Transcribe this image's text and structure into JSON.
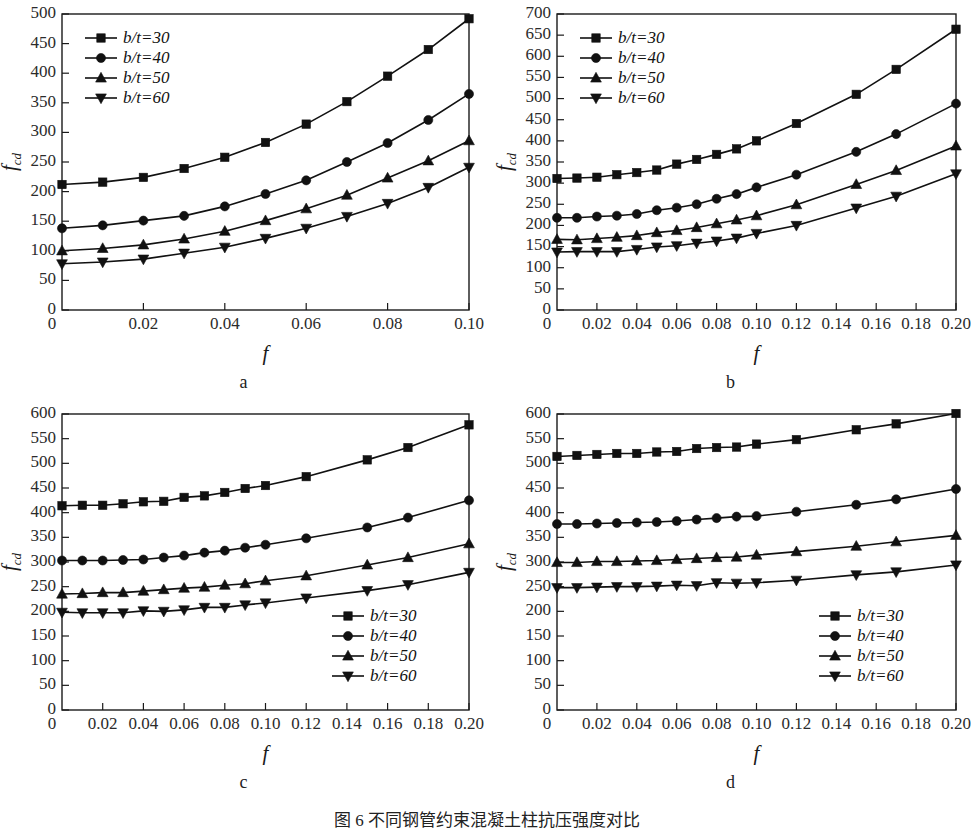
{
  "figure": {
    "caption": "图 6    不同钢管约束混凝土柱抗压强度对比",
    "axis_labels": {
      "x": "f",
      "y_base": "f",
      "y_sub": "cd"
    },
    "legend_labels": [
      "b/t=30",
      "b/t=40",
      "b/t=50",
      "b/t=60"
    ],
    "legend_markers": [
      "square-marker",
      "circle-marker",
      "triangle-up-marker",
      "triangle-down-marker"
    ]
  },
  "chart_data": [
    {
      "id": "a",
      "type": "line",
      "panel_letter": "a",
      "title": "",
      "xlabel": "f",
      "ylabel": "f_cd",
      "xlim": [
        0,
        0.1
      ],
      "ylim": [
        0,
        500
      ],
      "ytick_step": 50,
      "yticks": [
        0,
        50,
        100,
        150,
        200,
        250,
        300,
        350,
        400,
        450,
        500
      ],
      "xticks": [
        0,
        0.02,
        0.04,
        0.06,
        0.08,
        0.1
      ],
      "xtick_labels": [
        "0",
        "0.02",
        "0.04",
        "0.06",
        "0.08",
        "0.10"
      ],
      "grid": false,
      "legend_position": "top-left",
      "x": [
        0,
        0.01,
        0.02,
        0.03,
        0.04,
        0.05,
        0.06,
        0.07,
        0.08,
        0.09,
        0.1
      ],
      "series": [
        {
          "name": "b/t=30",
          "marker": "square",
          "values": [
            212,
            216,
            224,
            239,
            258,
            283,
            314,
            352,
            395,
            440,
            492
          ]
        },
        {
          "name": "b/t=40",
          "marker": "circle",
          "values": [
            138,
            143,
            151,
            159,
            175,
            196,
            219,
            250,
            282,
            321,
            365
          ]
        },
        {
          "name": "b/t=50",
          "marker": "triangle-up",
          "values": [
            100,
            104,
            110,
            120,
            133,
            151,
            171,
            194,
            223,
            252,
            286
          ]
        },
        {
          "name": "b/t=60",
          "marker": "triangle-down",
          "values": [
            78,
            81,
            86,
            96,
            106,
            121,
            138,
            158,
            180,
            207,
            241
          ]
        }
      ]
    },
    {
      "id": "b",
      "type": "line",
      "panel_letter": "b",
      "title": "",
      "xlabel": "f",
      "ylabel": "f_cd",
      "xlim": [
        0,
        0.2
      ],
      "ylim": [
        0,
        700
      ],
      "ytick_step": 50,
      "yticks": [
        0,
        50,
        100,
        150,
        200,
        250,
        300,
        350,
        400,
        450,
        500,
        550,
        600,
        650,
        700
      ],
      "xticks": [
        0,
        0.02,
        0.04,
        0.06,
        0.08,
        0.1,
        0.12,
        0.14,
        0.16,
        0.18,
        0.2
      ],
      "xtick_labels": [
        "0",
        "0.02",
        "0.04",
        "0.06",
        "0.08",
        "0.10",
        "0.12",
        "0.14",
        "0.16",
        "0.18",
        "0.20"
      ],
      "grid": false,
      "legend_position": "top-left",
      "x": [
        0,
        0.01,
        0.02,
        0.03,
        0.04,
        0.05,
        0.06,
        0.07,
        0.08,
        0.09,
        0.1,
        0.12,
        0.15,
        0.17,
        0.2
      ],
      "series": [
        {
          "name": "b/t=30",
          "marker": "square",
          "values": [
            311,
            312,
            314,
            320,
            325,
            331,
            345,
            356,
            368,
            381,
            400,
            441,
            510,
            569,
            664
          ]
        },
        {
          "name": "b/t=40",
          "marker": "circle",
          "values": [
            218,
            218,
            221,
            223,
            227,
            236,
            242,
            250,
            263,
            274,
            290,
            320,
            374,
            416,
            488
          ]
        },
        {
          "name": "b/t=50",
          "marker": "triangle-up",
          "values": [
            167,
            166,
            169,
            172,
            176,
            183,
            188,
            195,
            204,
            213,
            223,
            249,
            297,
            330,
            388
          ]
        },
        {
          "name": "b/t=60",
          "marker": "triangle-down",
          "values": [
            137,
            138,
            138,
            138,
            143,
            149,
            152,
            158,
            163,
            170,
            181,
            200,
            241,
            269,
            322
          ]
        }
      ]
    },
    {
      "id": "c",
      "type": "line",
      "panel_letter": "c",
      "title": "",
      "xlabel": "f",
      "ylabel": "f_cd",
      "xlim": [
        0,
        0.2
      ],
      "ylim": [
        0,
        600
      ],
      "ytick_step": 50,
      "yticks": [
        0,
        50,
        100,
        150,
        200,
        250,
        300,
        350,
        400,
        450,
        500,
        550,
        600
      ],
      "xticks": [
        0,
        0.02,
        0.04,
        0.06,
        0.08,
        0.1,
        0.12,
        0.14,
        0.16,
        0.18,
        0.2
      ],
      "xtick_labels": [
        "0",
        "0.02",
        "0.04",
        "0.06",
        "0.08",
        "0.10",
        "0.12",
        "0.14",
        "0.16",
        "0.18",
        "0.20"
      ],
      "grid": false,
      "legend_position": "bottom-right",
      "x": [
        0,
        0.01,
        0.02,
        0.03,
        0.04,
        0.05,
        0.06,
        0.07,
        0.08,
        0.09,
        0.1,
        0.12,
        0.15,
        0.17,
        0.2
      ],
      "series": [
        {
          "name": "b/t=30",
          "marker": "square",
          "values": [
            414,
            415,
            415,
            418,
            422,
            423,
            431,
            434,
            441,
            449,
            455,
            473,
            507,
            532,
            578
          ]
        },
        {
          "name": "b/t=40",
          "marker": "circle",
          "values": [
            303,
            303,
            303,
            304,
            305,
            309,
            313,
            319,
            323,
            329,
            335,
            348,
            370,
            390,
            425
          ]
        },
        {
          "name": "b/t=50",
          "marker": "triangle-up",
          "values": [
            235,
            236,
            238,
            238,
            241,
            244,
            247,
            249,
            253,
            256,
            262,
            272,
            294,
            309,
            337
          ]
        },
        {
          "name": "b/t=60",
          "marker": "triangle-down",
          "values": [
            198,
            197,
            197,
            197,
            201,
            200,
            203,
            208,
            208,
            213,
            217,
            227,
            242,
            254,
            279
          ]
        }
      ]
    },
    {
      "id": "d",
      "type": "line",
      "panel_letter": "d",
      "title": "",
      "xlabel": "f",
      "ylabel": "f_cd",
      "xlim": [
        0,
        0.2
      ],
      "ylim": [
        0,
        600
      ],
      "ytick_step": 50,
      "yticks": [
        0,
        50,
        100,
        150,
        200,
        250,
        300,
        350,
        400,
        450,
        500,
        550,
        600
      ],
      "xticks": [
        0,
        0.02,
        0.04,
        0.06,
        0.08,
        0.1,
        0.12,
        0.14,
        0.16,
        0.18,
        0.2
      ],
      "xtick_labels": [
        "0",
        "0.02",
        "0.04",
        "0.06",
        "0.08",
        "0.10",
        "0.12",
        "0.14",
        "0.16",
        "0.18",
        "0.20"
      ],
      "grid": false,
      "legend_position": "bottom-right",
      "x": [
        0,
        0.01,
        0.02,
        0.03,
        0.04,
        0.05,
        0.06,
        0.07,
        0.08,
        0.09,
        0.1,
        0.12,
        0.15,
        0.17,
        0.2
      ],
      "series": [
        {
          "name": "b/t=30",
          "marker": "square",
          "values": [
            514,
            516,
            518,
            520,
            520,
            523,
            524,
            530,
            532,
            533,
            539,
            548,
            568,
            580,
            601
          ]
        },
        {
          "name": "b/t=40",
          "marker": "circle",
          "values": [
            377,
            377,
            378,
            379,
            380,
            381,
            383,
            386,
            389,
            392,
            393,
            402,
            416,
            427,
            448
          ]
        },
        {
          "name": "b/t=50",
          "marker": "triangle-up",
          "values": [
            299,
            299,
            301,
            301,
            302,
            303,
            305,
            307,
            309,
            310,
            314,
            321,
            332,
            341,
            354
          ]
        },
        {
          "name": "b/t=60",
          "marker": "triangle-down",
          "values": [
            248,
            248,
            249,
            250,
            250,
            251,
            253,
            252,
            258,
            257,
            258,
            263,
            274,
            280,
            294
          ]
        }
      ]
    }
  ]
}
